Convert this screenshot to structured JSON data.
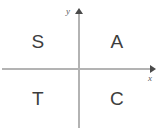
{
  "chart_data": {
    "type": "scatter",
    "title": "",
    "xlabel": "x",
    "ylabel": "y",
    "grid": false,
    "legend": false,
    "axes": {
      "x_label": "x",
      "y_label": "y",
      "x_arrow": "right",
      "y_arrow": "up",
      "origin_shown": true,
      "tick_labels": []
    },
    "categories": [
      "Quadrant II",
      "Quadrant I",
      "Quadrant III",
      "Quadrant IV"
    ],
    "annotations": [
      {
        "text": "S",
        "quadrant": "upper-left",
        "x": -1,
        "y": 1
      },
      {
        "text": "A",
        "quadrant": "upper-right",
        "x": 1,
        "y": 1
      },
      {
        "text": "T",
        "quadrant": "lower-left",
        "x": -1,
        "y": -1
      },
      {
        "text": "C",
        "quadrant": "lower-right",
        "x": 1,
        "y": -1
      }
    ]
  },
  "diagram": {
    "axes": {
      "x_name": "x",
      "y_name": "y"
    },
    "quadrants": {
      "upper_left": "S",
      "upper_right": "A",
      "lower_left": "T",
      "lower_right": "C"
    }
  },
  "colors": {
    "background": "#ffffff",
    "axis_line": "#b3b3b3",
    "arrow_head": "#4a4a4a",
    "quadrant_text": "#3d3d3d",
    "axis_label_text": "#5a5a5a"
  }
}
